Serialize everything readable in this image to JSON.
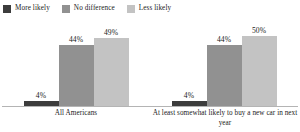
{
  "chart_data": {
    "type": "bar",
    "title": "",
    "subtitle": "",
    "xlabel": "",
    "ylabel": "",
    "ylim": [
      0,
      60
    ],
    "grid": false,
    "legend_position": "top-left",
    "categories": [
      "All Americans",
      "At least somewhat likely to buy a new car in next year"
    ],
    "series": [
      {
        "name": "More likely",
        "color": "#3c3c3c",
        "values": [
          4,
          4
        ],
        "labels": [
          "4%",
          "4%"
        ]
      },
      {
        "name": "No difference",
        "color": "#919191",
        "values": [
          44,
          44
        ],
        "labels": [
          "44%",
          "44%"
        ]
      },
      {
        "name": "Less likely",
        "color": "#c3c3c3",
        "values": [
          49,
          50
        ],
        "labels": [
          "49%",
          "50%"
        ]
      }
    ]
  },
  "legend": {
    "items": [
      {
        "label": "More likely",
        "color": "#3c3c3c"
      },
      {
        "label": "No difference",
        "color": "#919191"
      },
      {
        "label": "Less likely",
        "color": "#c3c3c3"
      }
    ]
  },
  "axis": {
    "line_color": "#b4b4b4"
  },
  "groups": [
    {
      "category": "All Americans",
      "bars": [
        {
          "series": "More likely",
          "value": 4,
          "label": "4%",
          "color": "#3c3c3c"
        },
        {
          "series": "No difference",
          "value": 44,
          "label": "44%",
          "color": "#919191"
        },
        {
          "series": "Less likely",
          "value": 49,
          "label": "49%",
          "color": "#c3c3c3"
        }
      ]
    },
    {
      "category": "At least somewhat likely to buy a new car in next year",
      "bars": [
        {
          "series": "More likely",
          "value": 4,
          "label": "4%",
          "color": "#3c3c3c"
        },
        {
          "series": "No difference",
          "value": 44,
          "label": "44%",
          "color": "#919191"
        },
        {
          "series": "Less likely",
          "value": 50,
          "label": "50%",
          "color": "#c3c3c3"
        }
      ]
    }
  ]
}
